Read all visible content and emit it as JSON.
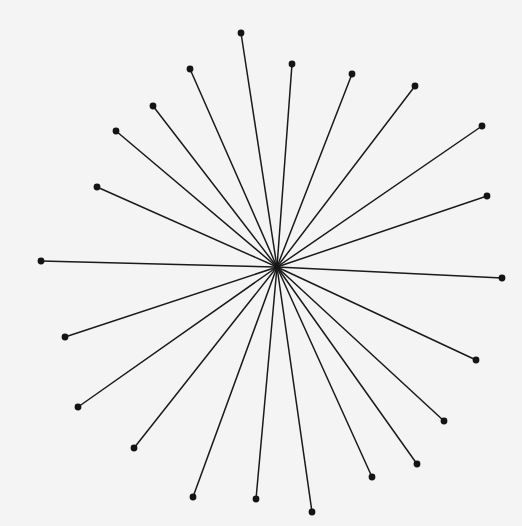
{
  "figure": {
    "background_color": "#f4f4f4",
    "stroke_color": "#1a1a1a",
    "dot_color": "#141414",
    "stroke_width": 1.5,
    "dot_radius": 3.4,
    "width": 522,
    "height": 526
  },
  "chart_data": {
    "type": "scatter",
    "title": "",
    "subtitle": "",
    "xlabel": "",
    "ylabel": "",
    "xlim": [
      0,
      522
    ],
    "ylim": [
      0,
      526
    ],
    "grid": false,
    "legend": null,
    "annotations": [],
    "center": {
      "x": 277,
      "y": 267,
      "label": "hub"
    },
    "ray_count": 22,
    "series": [
      {
        "name": "rays",
        "description": "Line segments drawn from the center hub to each endpoint dot",
        "endpoints": [
          {
            "id": 1,
            "x": 241,
            "y": 33,
            "angle_deg": 94.9,
            "length": 234.8
          },
          {
            "id": 2,
            "x": 292,
            "y": 64,
            "angle_deg": 85.7,
            "length": 203.5
          },
          {
            "id": 3,
            "x": 190,
            "y": 69,
            "angle_deg": 114.7,
            "length": 218.0
          },
          {
            "id": 4,
            "x": 352,
            "y": 74,
            "angle_deg": 67.9,
            "length": 208.3
          },
          {
            "id": 5,
            "x": 415,
            "y": 86,
            "angle_deg": 52.3,
            "length": 226.6
          },
          {
            "id": 6,
            "x": 153,
            "y": 106,
            "angle_deg": 130.6,
            "length": 208.1
          },
          {
            "id": 7,
            "x": 116,
            "y": 131,
            "angle_deg": 139.7,
            "length": 211.3
          },
          {
            "id": 8,
            "x": 482,
            "y": 126,
            "angle_deg": 34.7,
            "length": 249.3
          },
          {
            "id": 9,
            "x": 97,
            "y": 187,
            "angle_deg": 157.9,
            "length": 194.4
          },
          {
            "id": 10,
            "x": 487,
            "y": 196,
            "angle_deg": 18.7,
            "length": 221.8
          },
          {
            "id": 11,
            "x": 41,
            "y": 261,
            "angle_deg": 178.6,
            "length": 236.1
          },
          {
            "id": 12,
            "x": 502,
            "y": 278,
            "angle_deg": -2.8,
            "length": 225.3
          },
          {
            "id": 13,
            "x": 65,
            "y": 337,
            "angle_deg": -161.7,
            "length": 223.3
          },
          {
            "id": 14,
            "x": 476,
            "y": 360,
            "angle_deg": -25.0,
            "length": 219.5
          },
          {
            "id": 15,
            "x": 78,
            "y": 407,
            "angle_deg": -143.1,
            "length": 248.9
          },
          {
            "id": 16,
            "x": 444,
            "y": 421,
            "angle_deg": -42.5,
            "length": 226.3
          },
          {
            "id": 17,
            "x": 134,
            "y": 448,
            "angle_deg": -128.3,
            "length": 230.9
          },
          {
            "id": 18,
            "x": 417,
            "y": 464,
            "angle_deg": -55.4,
            "length": 239.0
          },
          {
            "id": 19,
            "x": 193,
            "y": 497,
            "angle_deg": -107.9,
            "length": 242.3
          },
          {
            "id": 20,
            "x": 372,
            "y": 477,
            "angle_deg": -65.9,
            "length": 230.1
          },
          {
            "id": 21,
            "x": 256,
            "y": 499,
            "angle_deg": -94.9,
            "length": 232.8
          },
          {
            "id": 22,
            "x": 312,
            "y": 512,
            "angle_deg": -81.4,
            "length": 247.6
          }
        ]
      }
    ]
  }
}
